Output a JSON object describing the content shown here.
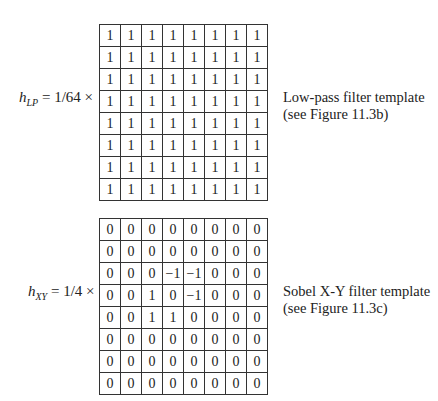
{
  "filters": [
    {
      "id": "lp",
      "symbol": "h",
      "subscript": "LP",
      "scale": "= 1/64 ×",
      "matrix": [
        [
          "1",
          "1",
          "1",
          "1",
          "1",
          "1",
          "1",
          "1"
        ],
        [
          "1",
          "1",
          "1",
          "1",
          "1",
          "1",
          "1",
          "1"
        ],
        [
          "1",
          "1",
          "1",
          "1",
          "1",
          "1",
          "1",
          "1"
        ],
        [
          "1",
          "1",
          "1",
          "1",
          "1",
          "1",
          "1",
          "1"
        ],
        [
          "1",
          "1",
          "1",
          "1",
          "1",
          "1",
          "1",
          "1"
        ],
        [
          "1",
          "1",
          "1",
          "1",
          "1",
          "1",
          "1",
          "1"
        ],
        [
          "1",
          "1",
          "1",
          "1",
          "1",
          "1",
          "1",
          "1"
        ],
        [
          "1",
          "1",
          "1",
          "1",
          "1",
          "1",
          "1",
          "1"
        ]
      ],
      "caption_line1": "Low-pass filter template",
      "caption_line2": "(see Figure 11.3b)"
    },
    {
      "id": "xy",
      "symbol": "h",
      "subscript": "XY",
      "scale": "= 1/4 ×",
      "matrix": [
        [
          "0",
          "0",
          "0",
          "0",
          "0",
          "0",
          "0",
          "0"
        ],
        [
          "0",
          "0",
          "0",
          "0",
          "0",
          "0",
          "0",
          "0"
        ],
        [
          "0",
          "0",
          "0",
          "−1",
          "−1",
          "0",
          "0",
          "0"
        ],
        [
          "0",
          "0",
          "1",
          "0",
          "−1",
          "0",
          "0",
          "0"
        ],
        [
          "0",
          "0",
          "1",
          "1",
          "0",
          "0",
          "0",
          "0"
        ],
        [
          "0",
          "0",
          "0",
          "0",
          "0",
          "0",
          "0",
          "0"
        ],
        [
          "0",
          "0",
          "0",
          "0",
          "0",
          "0",
          "0",
          "0"
        ],
        [
          "0",
          "0",
          "0",
          "0",
          "0",
          "0",
          "0",
          "0"
        ]
      ],
      "caption_line1": "Sobel X-Y filter template",
      "caption_line2": "(see Figure 11.3c)"
    }
  ]
}
